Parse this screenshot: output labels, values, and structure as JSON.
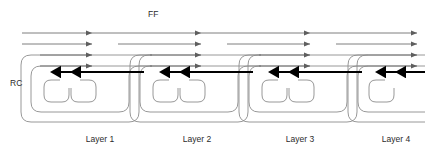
{
  "figure": {
    "type": "neural-network-architecture-diagram",
    "title": "",
    "background_color": "#ffffff"
  },
  "labels": {
    "ff": "FF",
    "rc": "RC"
  },
  "colors": {
    "feedforward_line": "#6f6f6f",
    "recurrent_line": "#8c8c8c",
    "vertical_arrow": "#000000",
    "text": "#2b2b2b",
    "background": "#ffffff"
  },
  "layers": [
    {
      "id": "layer-1",
      "label": "Layer 1",
      "center_x": 100,
      "arrow_x": [
        60,
        80
      ]
    },
    {
      "id": "layer-2",
      "label": "Layer 2",
      "center_x": 197,
      "arrow_x": [
        169,
        189
      ]
    },
    {
      "id": "layer-3",
      "label": "Layer 3",
      "center_x": 300,
      "arrow_x": [
        278,
        298
      ]
    },
    {
      "id": "layer-4",
      "label": "Layer 4",
      "center_x": 396,
      "arrow_x": [
        385,
        405
      ]
    }
  ],
  "geometry": {
    "feedforward_rows_y": [
      33,
      44,
      55,
      66
    ],
    "vertical_arrow_top_y": 8,
    "vertical_arrow_tip_y": 84,
    "label_row_y": 142,
    "ff_label_position": {
      "x": 148,
      "y": 17
    },
    "rc_label_position": {
      "x": 10,
      "y": 86
    }
  },
  "legend": {
    "ff_meaning": "FF",
    "rc_meaning": "RC"
  }
}
